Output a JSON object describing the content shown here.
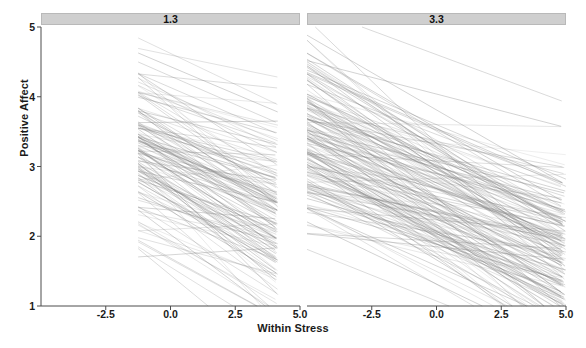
{
  "chart_data": {
    "type": "line",
    "title": "",
    "subtitle": "",
    "xlabel": "Within Stress",
    "ylabel": "Positive Affect",
    "xlim": [
      -5.0,
      5.0
    ],
    "ylim": [
      1,
      5
    ],
    "x_ticks": [
      -2.5,
      0.0,
      2.5,
      5.0
    ],
    "x_tick_labels": [
      "-2.5",
      "0.0",
      "2.5",
      "5.0"
    ],
    "y_ticks": [
      1,
      2,
      3,
      4,
      5
    ],
    "y_tick_labels": [
      "1",
      "2",
      "3",
      "4",
      "5"
    ],
    "grid": false,
    "legend": null,
    "facet_variable": "Between Stress",
    "panels": [
      {
        "strip_label": "1.3",
        "x_data_range": [
          -1.25,
          4.15
        ],
        "n_lines": 140,
        "description": "Spaghetti plot of per-person regression lines of Positive Affect on Within Stress; predominantly negative slopes.",
        "intercept_mean": 3.05,
        "intercept_sd": 0.62,
        "slope_mean": -0.185,
        "slope_sd": 0.085,
        "line_color": "#808080",
        "line_opacity": 0.35,
        "line_width": 0.7
      },
      {
        "strip_label": "3.3",
        "x_data_range": [
          -5.0,
          5.0
        ],
        "n_lines": 175,
        "description": "Spaghetti plot of per-person regression lines of Positive Affect on Within Stress; steeper negative slopes, wider x span.",
        "intercept_mean": 2.62,
        "intercept_sd": 0.6,
        "slope_mean": -0.175,
        "slope_sd": 0.075,
        "line_color": "#808080",
        "line_opacity": 0.35,
        "line_width": 0.7
      }
    ]
  },
  "axes": {
    "y_label": "Positive Affect",
    "x_label": "Within Stress",
    "y_tick_labels": [
      "5",
      "4",
      "3",
      "2",
      "1"
    ],
    "x_tick_labels_panel1": [
      "-2.5",
      "0.0",
      "2.5",
      "5.0"
    ],
    "x_tick_labels_panel2": [
      "-2.5",
      "0.0",
      "2.5",
      "5.0"
    ]
  },
  "strips": {
    "panel1": "1.3",
    "panel2": "3.3"
  },
  "colors": {
    "line": "#808080",
    "strip_fill": "#cfcfcf",
    "axis": "#4d4d4d",
    "text": "#1a1a1a",
    "background": "#ffffff"
  }
}
